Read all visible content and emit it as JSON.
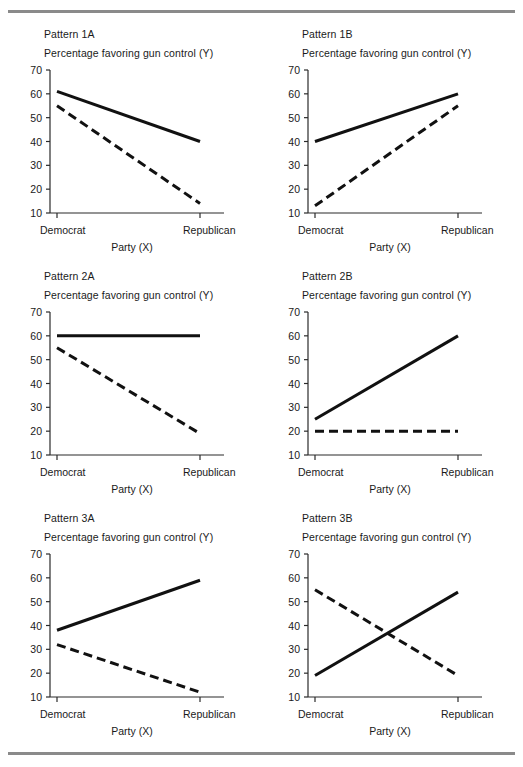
{
  "figure": {
    "panel_title_prefix": "Pattern",
    "y_axis_title": "Percentage favoring gun control (Y)",
    "x_axis_title": "Party (X)",
    "x_categories": [
      "Democrat",
      "Republican"
    ],
    "y_ticks": [
      "70",
      "60",
      "50",
      "40",
      "30",
      "20",
      "10"
    ],
    "rule_color": "#8a8a8a",
    "line_color": "#111111"
  },
  "chart_data": [
    {
      "type": "line",
      "title": "Pattern 1A",
      "xlabel": "Party (X)",
      "ylabel": "Percentage favoring gun control (Y)",
      "x": [
        "Democrat",
        "Republican"
      ],
      "ylim": [
        5,
        70
      ],
      "yticks": [
        10,
        20,
        30,
        40,
        50,
        60,
        70
      ],
      "grid": false,
      "legend": "none",
      "series": [
        {
          "name": "solid",
          "style": "solid",
          "values": [
            61,
            40
          ]
        },
        {
          "name": "dashed",
          "style": "dashed",
          "values": [
            55,
            14
          ]
        }
      ]
    },
    {
      "type": "line",
      "title": "Pattern 1B",
      "xlabel": "Party (X)",
      "ylabel": "Percentage favoring gun control (Y)",
      "x": [
        "Democrat",
        "Republican"
      ],
      "ylim": [
        5,
        70
      ],
      "yticks": [
        10,
        20,
        30,
        40,
        50,
        60,
        70
      ],
      "grid": false,
      "legend": "none",
      "series": [
        {
          "name": "solid",
          "style": "solid",
          "values": [
            40,
            60
          ]
        },
        {
          "name": "dashed",
          "style": "dashed",
          "values": [
            13,
            55
          ]
        }
      ]
    },
    {
      "type": "line",
      "title": "Pattern 2A",
      "xlabel": "Party (X)",
      "ylabel": "Percentage favoring gun control (Y)",
      "x": [
        "Democrat",
        "Republican"
      ],
      "ylim": [
        5,
        70
      ],
      "yticks": [
        10,
        20,
        30,
        40,
        50,
        60,
        70
      ],
      "grid": false,
      "legend": "none",
      "series": [
        {
          "name": "solid",
          "style": "solid",
          "values": [
            60,
            60
          ]
        },
        {
          "name": "dashed",
          "style": "dashed",
          "values": [
            55,
            19
          ]
        }
      ]
    },
    {
      "type": "line",
      "title": "Pattern 2B",
      "xlabel": "Party (X)",
      "ylabel": "Percentage favoring gun control (Y)",
      "x": [
        "Democrat",
        "Republican"
      ],
      "ylim": [
        5,
        70
      ],
      "yticks": [
        10,
        20,
        30,
        40,
        50,
        60,
        70
      ],
      "grid": false,
      "legend": "none",
      "series": [
        {
          "name": "solid",
          "style": "solid",
          "values": [
            25,
            60
          ]
        },
        {
          "name": "dashed",
          "style": "dashed",
          "values": [
            20,
            20
          ]
        }
      ]
    },
    {
      "type": "line",
      "title": "Pattern 3A",
      "xlabel": "Party (X)",
      "ylabel": "Percentage favoring gun control (Y)",
      "x": [
        "Democrat",
        "Republican"
      ],
      "ylim": [
        5,
        70
      ],
      "yticks": [
        10,
        20,
        30,
        40,
        50,
        60,
        70
      ],
      "grid": false,
      "legend": "none",
      "series": [
        {
          "name": "solid",
          "style": "solid",
          "values": [
            38,
            59
          ]
        },
        {
          "name": "dashed",
          "style": "dashed",
          "values": [
            32,
            12
          ]
        }
      ]
    },
    {
      "type": "line",
      "title": "Pattern 3B",
      "xlabel": "Party (X)",
      "ylabel": "Percentage favoring gun control (Y)",
      "x": [
        "Democrat",
        "Republican"
      ],
      "ylim": [
        5,
        70
      ],
      "yticks": [
        10,
        20,
        30,
        40,
        50,
        60,
        70
      ],
      "grid": false,
      "legend": "none",
      "series": [
        {
          "name": "solid",
          "style": "solid",
          "values": [
            19,
            54
          ]
        },
        {
          "name": "dashed",
          "style": "dashed",
          "values": [
            55,
            19
          ]
        }
      ]
    }
  ]
}
